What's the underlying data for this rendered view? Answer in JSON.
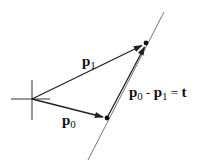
{
  "diagram": {
    "type": "vector-diagram",
    "origin": {
      "x": 32,
      "y": 99
    },
    "points": {
      "p0": {
        "x": 107,
        "y": 118
      },
      "p1": {
        "x": 146,
        "y": 43
      }
    },
    "labels": {
      "p1": {
        "base": "p",
        "sub": "1"
      },
      "p0": {
        "base": "p",
        "sub": "0"
      },
      "t_eq": {
        "a_base": "p",
        "a_sub": "0",
        "minus": " - ",
        "b_base": "p",
        "b_sub": "1",
        "equals": " = ",
        "rhs": "t"
      }
    },
    "colors": {
      "stroke": "#222222",
      "line": "#555555",
      "background": "#ffffff"
    }
  }
}
